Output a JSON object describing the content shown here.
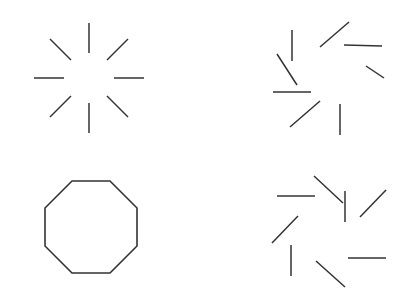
{
  "page": {
    "width": 411,
    "height": 297,
    "background_color": "#ffffff",
    "stroke_color": "#333333",
    "stroke_width": 1.5
  },
  "figures": [
    {
      "id": "top-left-starburst",
      "name": "radial-starburst",
      "position": "top-left",
      "type": "line-segment-array",
      "center": {
        "x": 89,
        "y": 78
      },
      "segment_count": 8,
      "inner_radius": 25,
      "outer_radius": 55,
      "rotation_offset_deg": 0,
      "note": "Eight straight segments pointing radially outward from a common empty center, forming an illusory octagon. Segment angles are evenly spaced at 45 degree intervals beginning at 0 degrees.",
      "angles_deg": [
        0,
        45,
        90,
        135,
        180,
        225,
        270,
        315
      ],
      "segments": [
        {
          "x1": 114,
          "y1": 78,
          "x2": 144,
          "y2": 78
        },
        {
          "x1": 107,
          "y1": 60,
          "x2": 128,
          "y2": 39
        },
        {
          "x1": 89,
          "y1": 53,
          "x2": 89,
          "y2": 23
        },
        {
          "x1": 71,
          "y1": 60,
          "x2": 50,
          "y2": 39
        },
        {
          "x1": 64,
          "y1": 78,
          "x2": 34,
          "y2": 78
        },
        {
          "x1": 71,
          "y1": 96,
          "x2": 50,
          "y2": 117
        },
        {
          "x1": 89,
          "y1": 103,
          "x2": 89,
          "y2": 133
        },
        {
          "x1": 107,
          "y1": 96,
          "x2": 128,
          "y2": 117
        }
      ]
    },
    {
      "id": "bottom-left-octagon",
      "name": "regular-octagon",
      "position": "bottom-left",
      "type": "closed-polygon",
      "center": {
        "x": 91,
        "y": 227
      },
      "sides": 8,
      "circumradius": 50,
      "rotation_offset_deg": 22.5,
      "note": "A complete regular octagon outline with a flat top edge and a flat bottom edge, drawn as a single unbroken closed contour.",
      "vertices": [
        {
          "x": 110,
          "y": 181
        },
        {
          "x": 137,
          "y": 208
        },
        {
          "x": 137,
          "y": 246
        },
        {
          "x": 110,
          "y": 273
        },
        {
          "x": 72,
          "y": 273
        },
        {
          "x": 45,
          "y": 246
        },
        {
          "x": 45,
          "y": 208
        },
        {
          "x": 72,
          "y": 181
        }
      ]
    },
    {
      "id": "top-right-pinwheel-cw",
      "name": "pinwheel-clockwise",
      "position": "top-right",
      "type": "line-segment-array",
      "center": {
        "x": 330,
        "y": 78
      },
      "segment_count": 8,
      "segment_length": 38,
      "midpoint_radius": 42,
      "local_rotation_deg": 38,
      "note": "The same eight segments as the starburst but each one pivoted about its own midpoint, producing a clockwise pinwheel in which no segment points at the centre.",
      "segments": [
        {
          "x1": 366,
          "y1": 66,
          "x2": 384,
          "y2": 78
        },
        {
          "x1": 344,
          "y1": 45,
          "x2": 382,
          "y2": 46
        },
        {
          "x1": 320,
          "y1": 47,
          "x2": 349,
          "y2": 22
        },
        {
          "x1": 292,
          "y1": 30,
          "x2": 292,
          "y2": 61
        },
        {
          "x1": 277,
          "y1": 54,
          "x2": 297,
          "y2": 85
        },
        {
          "x1": 273,
          "y1": 92,
          "x2": 311,
          "y2": 92
        },
        {
          "x1": 290,
          "y1": 127,
          "x2": 320,
          "y2": 101
        },
        {
          "x1": 340,
          "y1": 104,
          "x2": 340,
          "y2": 135
        }
      ]
    },
    {
      "id": "bottom-right-pinwheel-ccw",
      "name": "pinwheel-counterclockwise",
      "position": "bottom-right",
      "type": "line-segment-array",
      "center": {
        "x": 330,
        "y": 227
      },
      "segment_count": 8,
      "segment_length": 38,
      "midpoint_radius": 42,
      "local_rotation_deg": -38,
      "note": "Mirror image of the top-right figure: the eight segments are pivoted about their midpoints in the opposite sense, producing a counter-clockwise pinwheel.",
      "segments": [
        {
          "x1": 360,
          "y1": 217,
          "x2": 386,
          "y2": 190
        },
        {
          "x1": 345,
          "y1": 191,
          "x2": 345,
          "y2": 222
        },
        {
          "x1": 314,
          "y1": 176,
          "x2": 343,
          "y2": 203
        },
        {
          "x1": 277,
          "y1": 196,
          "x2": 315,
          "y2": 196
        },
        {
          "x1": 272,
          "y1": 243,
          "x2": 298,
          "y2": 216
        },
        {
          "x1": 291,
          "y1": 245,
          "x2": 291,
          "y2": 276
        },
        {
          "x1": 316,
          "y1": 261,
          "x2": 345,
          "y2": 287
        },
        {
          "x1": 348,
          "y1": 258,
          "x2": 386,
          "y2": 258
        }
      ]
    }
  ]
}
